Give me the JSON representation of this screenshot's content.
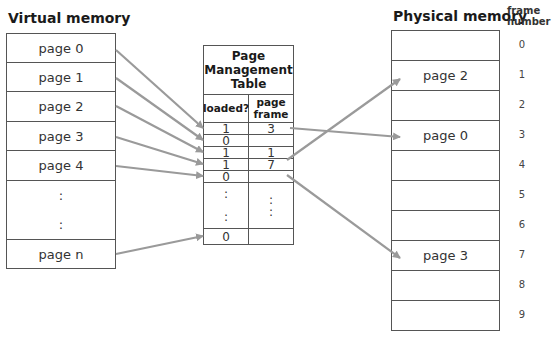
{
  "virtual_memory": {
    "title": "Virtual memory",
    "pages": [
      {
        "label": "page 0"
      },
      {
        "label": "page 1"
      },
      {
        "label": "page 2"
      },
      {
        "label": "page 3"
      },
      {
        "label": "page 4"
      },
      {
        "label": ":"
      },
      {
        "label": ":"
      },
      {
        "label": "page n"
      }
    ]
  },
  "page_management_table": {
    "title_line1": "Page",
    "title_line2": "Management",
    "title_line3": "Table",
    "col_loaded_label": "loaded?",
    "col_frame_line1": "page",
    "col_frame_line2": "frame",
    "rows": [
      {
        "loaded": "1",
        "frame": "3"
      },
      {
        "loaded": "0",
        "frame": ""
      },
      {
        "loaded": "1",
        "frame": "1"
      },
      {
        "loaded": "1",
        "frame": "7"
      },
      {
        "loaded": "0",
        "frame": ""
      },
      {
        "loaded": ":",
        "frame": ":"
      },
      {
        "loaded": ":",
        "frame": ":"
      },
      {
        "loaded": "0",
        "frame": ""
      }
    ]
  },
  "physical_memory": {
    "title": "Physical memory",
    "frame_number_label_line1": "frame",
    "frame_number_label_line2": "number",
    "frames": [
      {
        "number": "0",
        "content": ""
      },
      {
        "number": "1",
        "content": "page 2"
      },
      {
        "number": "2",
        "content": ""
      },
      {
        "number": "3",
        "content": "page 0"
      },
      {
        "number": "4",
        "content": ""
      },
      {
        "number": "5",
        "content": ""
      },
      {
        "number": "6",
        "content": ""
      },
      {
        "number": "7",
        "content": "page 3"
      },
      {
        "number": "8",
        "content": ""
      },
      {
        "number": "9",
        "content": ""
      }
    ]
  },
  "colors": {
    "arrow": "#9a9a9a",
    "border": "#555555"
  }
}
